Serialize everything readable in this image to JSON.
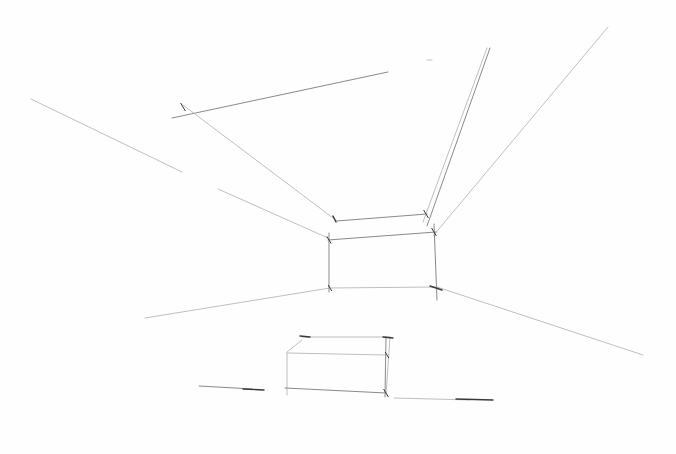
{
  "image": {
    "width": 676,
    "height": 454,
    "background": "#fefefe",
    "subject": "pencil one-point perspective sketch of a room interior with a box on the floor"
  },
  "strokes": {
    "faint": "#b8b8b8",
    "medium": "#8a8a8a",
    "dark": "#3a3a3a"
  },
  "groups": [
    {
      "name": "ceiling-lines",
      "lines": [
        {
          "x1": 172,
          "y1": 118,
          "x2": 388,
          "y2": 72,
          "tone": "medium"
        },
        {
          "x1": 183,
          "y1": 105,
          "x2": 337,
          "y2": 221,
          "tone": "faint"
        },
        {
          "x1": 337,
          "y1": 221,
          "x2": 427,
          "y2": 214,
          "tone": "medium"
        },
        {
          "x1": 427,
          "y1": 226,
          "x2": 490,
          "y2": 48,
          "tone": "medium"
        },
        {
          "x1": 423,
          "y1": 222,
          "x2": 487,
          "y2": 48,
          "tone": "faint"
        },
        {
          "x1": 433,
          "y1": 236,
          "x2": 608,
          "y2": 27,
          "tone": "faint"
        },
        {
          "x1": 427,
          "y1": 60,
          "x2": 432,
          "y2": 60,
          "tone": "faint"
        }
      ]
    },
    {
      "name": "left-wall-lines",
      "lines": [
        {
          "x1": 31,
          "y1": 99,
          "x2": 182,
          "y2": 172,
          "tone": "faint"
        },
        {
          "x1": 218,
          "y1": 189,
          "x2": 328,
          "y2": 238,
          "tone": "faint"
        },
        {
          "x1": 145,
          "y1": 318,
          "x2": 330,
          "y2": 288,
          "tone": "faint"
        }
      ]
    },
    {
      "name": "back-wall-rectangle",
      "lines": [
        {
          "x1": 328,
          "y1": 240,
          "x2": 436,
          "y2": 232,
          "tone": "medium"
        },
        {
          "x1": 329,
          "y1": 233,
          "x2": 329,
          "y2": 292,
          "tone": "medium"
        },
        {
          "x1": 434,
          "y1": 224,
          "x2": 437,
          "y2": 300,
          "tone": "medium"
        },
        {
          "x1": 329,
          "y1": 288,
          "x2": 437,
          "y2": 287,
          "tone": "faint"
        },
        {
          "x1": 333,
          "y1": 216,
          "x2": 336,
          "y2": 222,
          "tone": "dark"
        }
      ]
    },
    {
      "name": "floor-lines",
      "lines": [
        {
          "x1": 437,
          "y1": 287,
          "x2": 643,
          "y2": 355,
          "tone": "faint"
        },
        {
          "x1": 430,
          "y1": 286,
          "x2": 442,
          "y2": 290,
          "tone": "dark"
        },
        {
          "x1": 199,
          "y1": 386,
          "x2": 253,
          "y2": 389,
          "tone": "medium"
        },
        {
          "x1": 243,
          "y1": 389,
          "x2": 264,
          "y2": 390,
          "tone": "dark"
        },
        {
          "x1": 394,
          "y1": 398,
          "x2": 470,
          "y2": 400,
          "tone": "faint"
        },
        {
          "x1": 456,
          "y1": 399,
          "x2": 493,
          "y2": 400,
          "tone": "dark"
        }
      ]
    },
    {
      "name": "box-on-floor",
      "lines": [
        {
          "x1": 302,
          "y1": 337,
          "x2": 390,
          "y2": 337,
          "tone": "faint"
        },
        {
          "x1": 300,
          "y1": 336,
          "x2": 310,
          "y2": 337,
          "tone": "dark"
        },
        {
          "x1": 287,
          "y1": 352,
          "x2": 302,
          "y2": 340,
          "tone": "faint"
        },
        {
          "x1": 287,
          "y1": 353,
          "x2": 386,
          "y2": 355,
          "tone": "faint"
        },
        {
          "x1": 287,
          "y1": 353,
          "x2": 287,
          "y2": 395,
          "tone": "faint"
        },
        {
          "x1": 285,
          "y1": 388,
          "x2": 386,
          "y2": 393,
          "tone": "medium"
        },
        {
          "x1": 386,
          "y1": 337,
          "x2": 385,
          "y2": 397,
          "tone": "medium"
        },
        {
          "x1": 390,
          "y1": 337,
          "x2": 386,
          "y2": 395,
          "tone": "faint"
        },
        {
          "x1": 383,
          "y1": 337,
          "x2": 393,
          "y2": 338,
          "tone": "dark"
        }
      ]
    }
  ],
  "tick_marks": [
    {
      "x": 183,
      "y": 107,
      "len": 8
    },
    {
      "x": 426,
      "y": 214,
      "len": 8
    },
    {
      "x": 434,
      "y": 232,
      "len": 8
    },
    {
      "x": 329,
      "y": 240,
      "len": 7
    },
    {
      "x": 330,
      "y": 288,
      "len": 6
    },
    {
      "x": 387,
      "y": 355,
      "len": 6
    },
    {
      "x": 386,
      "y": 393,
      "len": 8
    }
  ]
}
